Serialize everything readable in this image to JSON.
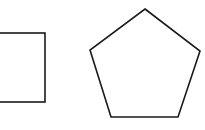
{
  "canvas": {
    "width": 205,
    "height": 130,
    "background": "#ffffff"
  },
  "stroke": {
    "color": "#1a1a1a",
    "width": 1.6
  },
  "shapes": [
    {
      "type": "square",
      "partially_cropped": true,
      "x": -25,
      "y": 33,
      "width": 70,
      "height": 69
    },
    {
      "type": "pentagon",
      "points": "145,9 200,51 178,117 111,117 90,50"
    }
  ]
}
